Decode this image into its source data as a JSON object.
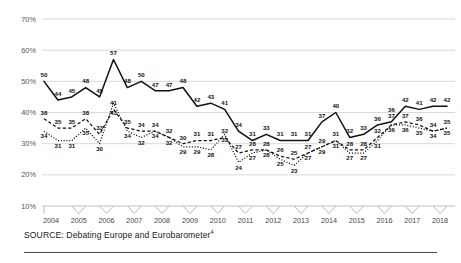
{
  "source": {
    "prefix": "SOURCE:",
    "text": "SOURCE: Debating Europe and Eurobarometer",
    "marker": "4"
  },
  "axis": {
    "y_ticks": [
      "10%",
      "20%",
      "30%",
      "40%",
      "50%",
      "60%",
      "70%"
    ],
    "x_ticks": [
      "2004",
      "2005",
      "2006",
      "2007",
      "2008",
      "2009",
      "2010",
      "2011",
      "2012",
      "2013",
      "2014",
      "2015",
      "2016",
      "2017",
      "2018"
    ]
  },
  "colors": {
    "line": "#111111",
    "grid": "#c9c9c9",
    "axis_text": "#555555",
    "rule": "#4a4a4a",
    "background": "#ffffff"
  },
  "chart_data": {
    "type": "line",
    "title": "",
    "subtitle": "",
    "xlabel": "",
    "ylabel": "",
    "ylim": [
      10,
      70
    ],
    "ytick_values": [
      10,
      20,
      30,
      40,
      50,
      60,
      70
    ],
    "ytick_labels": [
      "10%",
      "20%",
      "30%",
      "40%",
      "50%",
      "60%",
      "70%"
    ],
    "grid": "horizontal",
    "legend": "none",
    "x_tick_labels": [
      "2004",
      "2005",
      "2006",
      "2007",
      "2008",
      "2009",
      "2010",
      "2011",
      "2012",
      "2013",
      "2014",
      "2015",
      "2016",
      "2017",
      "2018"
    ],
    "x_points_per_tick": 2,
    "x": [
      "2004 H1",
      "2004 H2",
      "2005 H1",
      "2005 H2",
      "2006 H1",
      "2006 H2",
      "2007 H1",
      "2007 H2",
      "2008 H1",
      "2008 H2",
      "2009 H1",
      "2009 H2",
      "2010 H1",
      "2010 H2",
      "2011 H1",
      "2011 H2",
      "2012 H1",
      "2012 H2",
      "2013 H1",
      "2013 H2",
      "2014 H1",
      "2014 H2",
      "2015 H1",
      "2015 H2",
      "2016 H1",
      "2016 H2",
      "2017 H1",
      "2017 H2",
      "2018 H1",
      "2018 H2"
    ],
    "series": [
      {
        "name": "solid-line",
        "style": "solid",
        "values": [
          50,
          44,
          45,
          48,
          45,
          57,
          48,
          50,
          47,
          47,
          48,
          42,
          43,
          41,
          34,
          31,
          33,
          31,
          31,
          31,
          37,
          40,
          32,
          33,
          36,
          37,
          42,
          41,
          42,
          42
        ]
      },
      {
        "name": "dashed-line",
        "style": "dashed",
        "values": [
          38,
          35,
          35,
          38,
          33,
          41,
          35,
          34,
          34,
          32,
          30,
          31,
          31,
          32,
          27,
          28,
          28,
          26,
          25,
          27,
          29,
          31,
          28,
          28,
          32,
          36,
          37,
          36,
          34,
          35
        ]
      },
      {
        "name": "dotted-line",
        "style": "dotted",
        "values": [
          34,
          31,
          31,
          35,
          30,
          43,
          34,
          32,
          34,
          32,
          29,
          29,
          28,
          33,
          24,
          27,
          28,
          25,
          23,
          27,
          29,
          31,
          27,
          27,
          31,
          36,
          36,
          35,
          34,
          35
        ]
      }
    ],
    "point_labels": {
      "solid": [
        50,
        44,
        45,
        48,
        45,
        57,
        48,
        50,
        47,
        47,
        48,
        42,
        43,
        41,
        34,
        31,
        33,
        31,
        31,
        31,
        37,
        40,
        32,
        33,
        36,
        37,
        42,
        41,
        42,
        42
      ],
      "dashed": [
        38,
        35,
        35,
        38,
        33,
        41,
        35,
        34,
        34,
        32,
        30,
        31,
        31,
        32,
        27,
        28,
        28,
        26,
        25,
        27,
        29,
        31,
        28,
        28,
        32,
        36,
        37,
        36,
        34,
        35
      ],
      "dotted": [
        34,
        31,
        31,
        35,
        30,
        43,
        34,
        32,
        34,
        32,
        29,
        29,
        28,
        33,
        24,
        27,
        28,
        25,
        23,
        27,
        29,
        31,
        27,
        27,
        31,
        36,
        36,
        35,
        34,
        35
      ]
    }
  }
}
